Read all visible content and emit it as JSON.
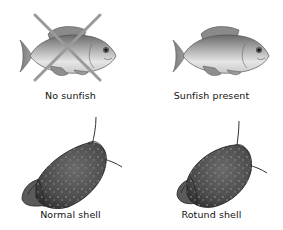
{
  "panels": [
    {
      "id": "no-sunfish",
      "caption": "No sunfish",
      "subject": "fish",
      "crossed_out": true
    },
    {
      "id": "sunfish-present",
      "caption": "Sunfish present",
      "subject": "fish",
      "crossed_out": false
    },
    {
      "id": "normal-shell",
      "caption": "Normal shell",
      "subject": "snail",
      "shape": "elongated"
    },
    {
      "id": "rotund-shell",
      "caption": "Rotund shell",
      "subject": "snail",
      "shape": "rotund"
    }
  ],
  "colors": {
    "background": "#ffffff",
    "caption_text": "#111111",
    "cross_lines": "#9a9a9a",
    "fish_dark": "#5a5a5a",
    "fish_mid": "#9c9c9c",
    "fish_light": "#e4e4e4",
    "snail_dark": "#3a3a3a",
    "snail_mid": "#5c5c5c",
    "snail_speckle": "#8a8a8a"
  }
}
